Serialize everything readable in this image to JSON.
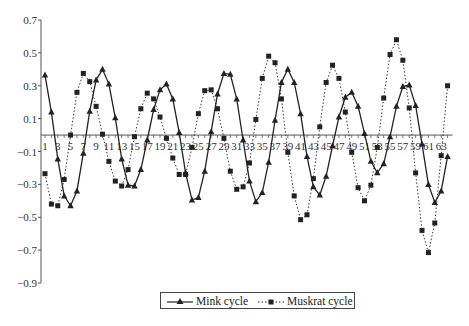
{
  "chart_data": {
    "type": "line",
    "title": "",
    "xlabel": "",
    "ylabel": "",
    "ylim": [
      -0.9,
      0.7
    ],
    "yticks": [
      0.7,
      0.5,
      0.3,
      0.1,
      -0.1,
      -0.3,
      -0.5,
      -0.7,
      -0.9
    ],
    "ytick_labels": [
      "0.7",
      "0.5",
      "0.3",
      "0.1",
      "−0.1",
      "−0.3",
      "−0.5",
      "−0.7",
      "−0.9"
    ],
    "xlim": [
      1,
      64
    ],
    "xtick_labels": [
      "1",
      "3",
      "5",
      "7",
      "9",
      "11",
      "13",
      "15",
      "17",
      "19",
      "21",
      "23",
      "25",
      "27",
      "29",
      "31",
      "33",
      "35",
      "37",
      "39",
      "41",
      "43",
      "45",
      "47",
      "49",
      "51",
      "53",
      "55",
      "57",
      "59",
      "61",
      "63"
    ],
    "x_axis_at": 0,
    "grid": false,
    "legend_position": "bottom-center",
    "x": [
      1,
      2,
      3,
      4,
      5,
      6,
      7,
      8,
      9,
      10,
      11,
      12,
      13,
      14,
      15,
      16,
      17,
      18,
      19,
      20,
      21,
      22,
      23,
      24,
      25,
      26,
      27,
      28,
      29,
      30,
      31,
      32,
      33,
      34,
      35,
      36,
      37,
      38,
      39,
      40,
      41,
      42,
      43,
      44,
      45,
      46,
      47,
      48,
      49,
      50,
      51,
      52,
      53,
      54,
      55,
      56,
      57,
      58,
      59,
      60,
      61,
      62,
      63,
      64
    ],
    "series": [
      {
        "name": "Mink cycle",
        "style": "solid",
        "marker": "triangle",
        "color": "#222222",
        "values": [
          0.365,
          0.14,
          -0.145,
          -0.37,
          -0.43,
          -0.34,
          -0.11,
          0.145,
          0.335,
          0.4,
          0.31,
          0.105,
          -0.145,
          -0.305,
          -0.31,
          -0.21,
          -0.03,
          0.155,
          0.275,
          0.31,
          0.22,
          0.015,
          -0.23,
          -0.395,
          -0.38,
          -0.22,
          0.02,
          0.25,
          0.375,
          0.37,
          0.22,
          -0.03,
          -0.28,
          -0.405,
          -0.35,
          -0.165,
          0.09,
          0.32,
          0.4,
          0.32,
          0.13,
          -0.13,
          -0.315,
          -0.365,
          -0.25,
          -0.065,
          0.11,
          0.23,
          0.26,
          0.175,
          0.01,
          -0.16,
          -0.23,
          -0.175,
          -0.01,
          0.175,
          0.295,
          0.305,
          0.18,
          -0.055,
          -0.3,
          -0.41,
          -0.34,
          -0.13
        ]
      },
      {
        "name": "Muskrat cycle",
        "style": "dotted",
        "marker": "square",
        "color": "#222222",
        "values": [
          -0.235,
          -0.42,
          -0.43,
          -0.27,
          0.0,
          0.26,
          0.375,
          0.325,
          0.175,
          0.005,
          -0.16,
          -0.28,
          -0.31,
          -0.21,
          -0.01,
          0.16,
          0.255,
          0.22,
          0.11,
          -0.02,
          -0.14,
          -0.24,
          -0.24,
          -0.075,
          0.13,
          0.27,
          0.275,
          0.16,
          -0.02,
          -0.22,
          -0.33,
          -0.315,
          -0.17,
          0.095,
          0.345,
          0.48,
          0.44,
          0.22,
          -0.105,
          -0.37,
          -0.515,
          -0.485,
          -0.265,
          0.05,
          0.32,
          0.425,
          0.345,
          0.14,
          -0.105,
          -0.32,
          -0.4,
          -0.305,
          -0.075,
          0.225,
          0.49,
          0.58,
          0.455,
          0.165,
          -0.23,
          -0.58,
          -0.715,
          -0.535,
          -0.125,
          0.3
        ]
      }
    ]
  },
  "legend": {
    "items": [
      {
        "label": "Mink cycle"
      },
      {
        "label": "Muskrat cycle"
      }
    ]
  }
}
